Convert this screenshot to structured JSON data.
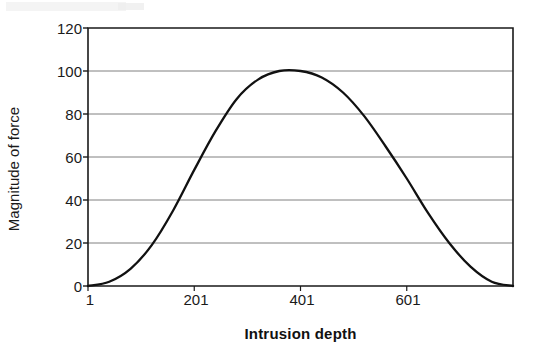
{
  "chart_data": {
    "type": "line",
    "title": "",
    "subtitle": "",
    "xlabel": "Intrusion depth",
    "ylabel": "Magnitude of force",
    "xlim": [
      1,
      801
    ],
    "ylim": [
      0,
      120
    ],
    "grid": true,
    "grid_axis": "y",
    "legend": "none",
    "x_tick_labels": [
      "1",
      "201",
      "401",
      "601"
    ],
    "x_tick_values": [
      1,
      201,
      401,
      601
    ],
    "y_tick_labels": [
      "0",
      "20",
      "40",
      "60",
      "80",
      "100",
      "120"
    ],
    "y_tick_values": [
      0,
      20,
      40,
      60,
      80,
      100,
      120
    ],
    "series": [
      {
        "name": "Magnitude of force",
        "color": "#111111",
        "x": [
          1,
          41,
          81,
          121,
          161,
          201,
          241,
          281,
          321,
          361,
          401,
          441,
          481,
          521,
          561,
          601,
          641,
          681,
          721,
          761,
          801
        ],
        "values": [
          0,
          2,
          8,
          19,
          35,
          54,
          72,
          87,
          96,
          100,
          100,
          97,
          90,
          79,
          65,
          50,
          34,
          20,
          9,
          2,
          0
        ]
      }
    ],
    "peak_value": 100,
    "peak_x": 401,
    "start_value": 0,
    "end_value": 0
  },
  "axes": {
    "y_title": "Magnitude of force",
    "x_title": "Intrusion depth",
    "y_ticks": [
      "120",
      "100",
      "80",
      "60",
      "40",
      "20",
      "0"
    ],
    "x_ticks": [
      "1",
      "201",
      "401",
      "601"
    ]
  },
  "colors": {
    "line": "#111111",
    "gridline": "#808080",
    "axis": "#1a1a1a",
    "background": "#ffffff",
    "text": "#1a1a1a"
  }
}
